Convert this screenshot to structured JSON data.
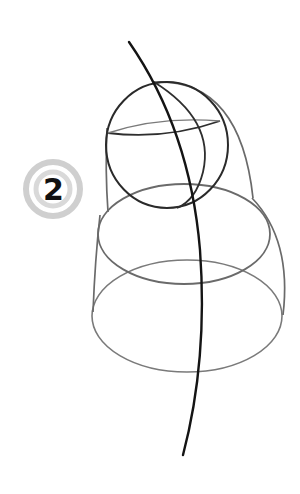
{
  "illustration": {
    "subject": "pencil sketch construction of a hooded figure / bell shape",
    "step_badge": {
      "number": "2",
      "ring_color": "#c8c8c8",
      "number_color": "#111111"
    },
    "stroke_colors": {
      "dark_guide": "#1a1a1a",
      "light_construction": "#6e6e6e"
    },
    "background": "#ffffff"
  }
}
